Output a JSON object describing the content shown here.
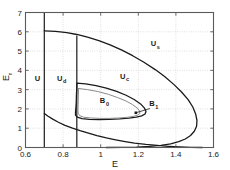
{
  "chart_data": {
    "type": "line",
    "title": "",
    "xlabel": "E",
    "ylabel": "E_r",
    "xlim": [
      0.6,
      1.6
    ],
    "ylim": [
      0,
      7
    ],
    "grid": true,
    "xticks": [
      0.6,
      0.8,
      1.0,
      1.2,
      1.4,
      1.6
    ],
    "xticklabels": [
      "0.6",
      "0.8",
      "1",
      "1.2",
      "1.4",
      "1.6"
    ],
    "yticks": [
      0,
      1,
      2,
      3,
      4,
      5,
      6,
      7
    ],
    "yticklabels": [
      "0",
      "1",
      "2",
      "3",
      "4",
      "5",
      "6",
      "7"
    ],
    "annotations": [
      {
        "name": "U",
        "base": "U",
        "sub": "",
        "x": 0.663,
        "y": 3.45
      },
      {
        "name": "U_d",
        "base": "U",
        "sub": "d",
        "x": 0.782,
        "y": 3.45
      },
      {
        "name": "U_c",
        "base": "U",
        "sub": "c",
        "x": 1.117,
        "y": 3.55
      },
      {
        "name": "U_s",
        "base": "U",
        "sub": "s",
        "x": 1.28,
        "y": 5.25
      },
      {
        "name": "B_0",
        "base": "B",
        "sub": "0",
        "x": 1.01,
        "y": 2.3
      },
      {
        "name": "B_1",
        "base": "B",
        "sub": "1",
        "x": 1.272,
        "y": 2.13
      }
    ],
    "markers": [
      {
        "name": "B_1-point",
        "x": 1.187,
        "y": 1.8
      }
    ],
    "leader_lines": [
      {
        "name": "B_1-leader",
        "x1": 1.187,
        "y1": 1.8,
        "x2": 1.262,
        "y2": 2.02
      }
    ],
    "series": [
      {
        "name": "vertical-line-left",
        "color": "#1a1a1a",
        "width": 1.2,
        "points": [
          [
            0.7,
            0.0
          ],
          [
            0.7,
            7.0
          ]
        ]
      },
      {
        "name": "vertical-line-mid",
        "color": "#1a1a1a",
        "width": 1.2,
        "points": [
          [
            0.873,
            0.0
          ],
          [
            0.873,
            5.78
          ]
        ]
      },
      {
        "name": "outer-upper-branch",
        "color": "#1a1a1a",
        "width": 1.3,
        "points": [
          [
            0.7,
            6.05
          ],
          [
            0.76,
            6.02
          ],
          [
            0.82,
            5.96
          ],
          [
            0.873,
            5.86
          ],
          [
            0.93,
            5.72
          ],
          [
            0.99,
            5.54
          ],
          [
            1.05,
            5.32
          ],
          [
            1.11,
            5.06
          ],
          [
            1.17,
            4.76
          ],
          [
            1.23,
            4.42
          ],
          [
            1.29,
            4.04
          ],
          [
            1.34,
            3.68
          ],
          [
            1.39,
            3.26
          ],
          [
            1.43,
            2.88
          ],
          [
            1.465,
            2.48
          ],
          [
            1.49,
            2.1
          ],
          [
            1.505,
            1.74
          ],
          [
            1.512,
            1.4
          ],
          [
            1.51,
            1.1
          ],
          [
            1.498,
            0.84
          ],
          [
            1.478,
            0.62
          ],
          [
            1.45,
            0.44
          ],
          [
            1.415,
            0.3
          ],
          [
            1.372,
            0.19
          ],
          [
            1.32,
            0.11
          ],
          [
            1.26,
            0.055
          ],
          [
            1.19,
            0.022
          ],
          [
            1.11,
            0.005
          ],
          [
            1.03,
            0.0
          ]
        ]
      },
      {
        "name": "outer-lower-branch",
        "color": "#1a1a1a",
        "width": 1.3,
        "points": [
          [
            0.7,
            1.76
          ],
          [
            0.72,
            1.62
          ],
          [
            0.745,
            1.47
          ],
          [
            0.775,
            1.31
          ],
          [
            0.81,
            1.15
          ],
          [
            0.85,
            1.0
          ],
          [
            0.89,
            0.87
          ],
          [
            0.935,
            0.74
          ],
          [
            0.98,
            0.62
          ],
          [
            1.03,
            0.5
          ],
          [
            1.08,
            0.4
          ],
          [
            1.13,
            0.31
          ],
          [
            1.18,
            0.23
          ],
          [
            1.24,
            0.16
          ],
          [
            1.3,
            0.105
          ],
          [
            1.36,
            0.062
          ],
          [
            1.42,
            0.03
          ],
          [
            1.48,
            0.01
          ],
          [
            1.54,
            0.0
          ]
        ]
      },
      {
        "name": "inner-oval-black",
        "color": "#1a1a1a",
        "width": 1.3,
        "points": [
          [
            0.873,
            3.34
          ],
          [
            0.92,
            3.3
          ],
          [
            0.975,
            3.21
          ],
          [
            1.03,
            3.08
          ],
          [
            1.085,
            2.91
          ],
          [
            1.135,
            2.71
          ],
          [
            1.178,
            2.49
          ],
          [
            1.212,
            2.26
          ],
          [
            1.233,
            2.04
          ],
          [
            1.241,
            1.87
          ],
          [
            1.236,
            1.74
          ],
          [
            1.218,
            1.64
          ],
          [
            1.19,
            1.57
          ],
          [
            1.15,
            1.52
          ],
          [
            1.1,
            1.48
          ],
          [
            1.045,
            1.46
          ],
          [
            0.99,
            1.45
          ],
          [
            0.94,
            1.46
          ],
          [
            0.9,
            1.5
          ],
          [
            0.876,
            1.57
          ],
          [
            0.866,
            1.68
          ],
          [
            0.866,
            1.84
          ],
          [
            0.868,
            2.05
          ],
          [
            0.87,
            2.35
          ],
          [
            0.871,
            2.75
          ],
          [
            0.873,
            3.1
          ],
          [
            0.873,
            3.34
          ]
        ]
      },
      {
        "name": "inner-oval-gray",
        "color": "#8a8a8a",
        "width": 1.0,
        "points": [
          [
            0.882,
            3.06
          ],
          [
            0.93,
            3.0
          ],
          [
            0.985,
            2.9
          ],
          [
            1.04,
            2.76
          ],
          [
            1.09,
            2.59
          ],
          [
            1.135,
            2.41
          ],
          [
            1.17,
            2.22
          ],
          [
            1.195,
            2.04
          ],
          [
            1.208,
            1.88
          ],
          [
            1.208,
            1.76
          ],
          [
            1.195,
            1.67
          ],
          [
            1.172,
            1.61
          ],
          [
            1.138,
            1.56
          ],
          [
            1.095,
            1.53
          ],
          [
            1.045,
            1.51
          ],
          [
            0.995,
            1.51
          ],
          [
            0.948,
            1.53
          ],
          [
            0.91,
            1.57
          ],
          [
            0.888,
            1.65
          ],
          [
            0.88,
            1.78
          ],
          [
            0.879,
            1.96
          ],
          [
            0.88,
            2.25
          ],
          [
            0.881,
            2.62
          ],
          [
            0.882,
            3.06
          ]
        ]
      }
    ]
  }
}
